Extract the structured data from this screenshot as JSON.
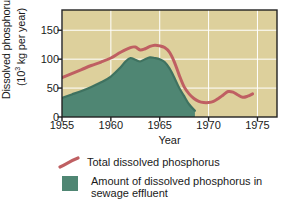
{
  "chart_data": {
    "type": "area",
    "title": "",
    "xlabel": "Year",
    "ylabel_line1": "Dissolved phosphorus",
    "ylabel_line2_pre": "(10",
    "ylabel_line2_sup": "3",
    "ylabel_line2_post": " kg per year)",
    "xlim": [
      1955,
      1977
    ],
    "ylim": [
      0,
      185
    ],
    "xticks": [
      1955,
      1960,
      1965,
      1970,
      1975
    ],
    "xtick_labels": [
      "1955",
      "1960",
      "1965",
      "1970",
      "1975"
    ],
    "yticks": [
      0,
      50,
      100,
      150
    ],
    "ytick_labels": [
      "0",
      "50",
      "100",
      "150"
    ],
    "grid": "white gridlines at each tick",
    "legend_position": "below plot, left aligned",
    "plot_background_color": "#ddd09c",
    "series": [
      {
        "name": "Total dissolved phosphorus",
        "type": "line",
        "color": "#bf5f62",
        "x": [
          1955,
          1956,
          1957,
          1958,
          1959,
          1960,
          1961,
          1962,
          1962.5,
          1963,
          1963.5,
          1964,
          1964.5,
          1965,
          1965.5,
          1966,
          1966.5,
          1967,
          1967.5,
          1968,
          1968.5,
          1969,
          1969.5,
          1970,
          1970.5,
          1971,
          1971.5,
          1972,
          1972.5,
          1973,
          1973.5,
          1974,
          1974.5
        ],
        "values": [
          68,
          75,
          82,
          89,
          95,
          102,
          112,
          120,
          121,
          116,
          118,
          122,
          124,
          123,
          120,
          112,
          95,
          72,
          52,
          40,
          32,
          27,
          25,
          25,
          27,
          32,
          38,
          44,
          43,
          38,
          34,
          36,
          40
        ]
      },
      {
        "name": "Amount of dissolved phosphorus in sewage effluent",
        "type": "area",
        "color": "#4f8673",
        "x": [
          1955,
          1956,
          1957,
          1958,
          1959,
          1960,
          1961,
          1961.5,
          1962,
          1962.5,
          1963,
          1963.5,
          1964,
          1964.5,
          1965,
          1965.5,
          1966,
          1966.5,
          1967,
          1967.5,
          1968,
          1968.6
        ],
        "values": [
          33,
          39,
          45,
          52,
          60,
          70,
          86,
          96,
          102,
          99,
          96,
          100,
          103,
          102,
          100,
          95,
          84,
          68,
          50,
          36,
          22,
          11
        ]
      }
    ]
  }
}
